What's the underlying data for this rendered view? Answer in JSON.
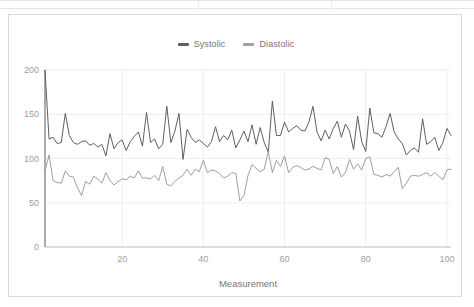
{
  "sheet_strip": {
    "name": "spreadsheet-row-strip",
    "visible": true,
    "column_divider_x": [
      198,
      331
    ]
  },
  "chart_card": {
    "background": "#ffffff",
    "border_color": "#d9d9d9"
  },
  "legend": {
    "position": "top-center",
    "items": [
      {
        "label": "Systolic",
        "color": "#5f5f5f"
      },
      {
        "label": "Diastolic",
        "color": "#9e9e9e"
      }
    ]
  },
  "axes": {
    "x": {
      "label": "Measurement",
      "ticks": [
        "20",
        "40",
        "60",
        "80",
        "100"
      ],
      "tick_values": [
        20,
        40,
        60,
        80,
        100
      ],
      "min": 1,
      "max": 101
    },
    "y": {
      "label": "",
      "ticks": [
        "0",
        "50",
        "100",
        "150",
        "200"
      ],
      "tick_values": [
        0,
        50,
        100,
        150,
        200
      ],
      "min": 0,
      "max": 200
    }
  },
  "chart_data": {
    "type": "line",
    "title": "",
    "subtitle": "",
    "xlabel": "Measurement",
    "ylabel": "",
    "xlim": [
      1,
      101
    ],
    "ylim": [
      0,
      200
    ],
    "grid": true,
    "grid_axis": "both",
    "legend_position": "top-center",
    "x": [
      1,
      2,
      3,
      4,
      5,
      6,
      7,
      8,
      9,
      10,
      11,
      12,
      13,
      14,
      15,
      16,
      17,
      18,
      19,
      20,
      21,
      22,
      23,
      24,
      25,
      26,
      27,
      28,
      29,
      30,
      31,
      32,
      33,
      34,
      35,
      36,
      37,
      38,
      39,
      40,
      41,
      42,
      43,
      44,
      45,
      46,
      47,
      48,
      49,
      50,
      51,
      52,
      53,
      54,
      55,
      56,
      57,
      58,
      59,
      60,
      61,
      62,
      63,
      64,
      65,
      66,
      67,
      68,
      69,
      70,
      71,
      72,
      73,
      74,
      75,
      76,
      77,
      78,
      79,
      80,
      81,
      82,
      83,
      84,
      85,
      86,
      87,
      88,
      89,
      90,
      91,
      92,
      93,
      94,
      95,
      96,
      97,
      98,
      99,
      100,
      101
    ],
    "series": [
      {
        "name": "Systolic",
        "color": "#5f5f5f",
        "values": [
          200,
          122,
          124,
          117,
          118,
          151,
          126,
          118,
          116,
          119,
          120,
          115,
          117,
          113,
          116,
          103,
          128,
          111,
          118,
          121,
          109,
          119,
          125,
          130,
          114,
          152,
          118,
          122,
          111,
          116,
          159,
          118,
          131,
          151,
          99,
          133,
          124,
          118,
          121,
          117,
          113,
          119,
          136,
          119,
          126,
          121,
          132,
          112,
          121,
          131,
          119,
          138,
          116,
          135,
          118,
          107,
          165,
          126,
          126,
          141,
          130,
          134,
          137,
          132,
          131,
          141,
          159,
          130,
          120,
          132,
          122,
          134,
          142,
          124,
          139,
          131,
          110,
          148,
          119,
          108,
          157,
          129,
          128,
          124,
          136,
          151,
          130,
          122,
          117,
          104,
          109,
          112,
          107,
          145,
          116,
          119,
          124,
          109,
          118,
          134,
          126
        ]
      },
      {
        "name": "Diastolic",
        "color": "#9e9e9e",
        "values": [
          86,
          104,
          75,
          73,
          72,
          86,
          80,
          79,
          67,
          58,
          74,
          71,
          80,
          77,
          72,
          84,
          75,
          70,
          74,
          77,
          76,
          80,
          78,
          86,
          78,
          78,
          77,
          81,
          75,
          91,
          71,
          69,
          74,
          78,
          81,
          88,
          81,
          88,
          85,
          98,
          84,
          87,
          86,
          83,
          78,
          80,
          84,
          83,
          52,
          58,
          81,
          93,
          89,
          85,
          88,
          108,
          84,
          98,
          91,
          103,
          84,
          90,
          92,
          90,
          87,
          88,
          91,
          89,
          87,
          101,
          99,
          83,
          91,
          79,
          84,
          99,
          88,
          94,
          87,
          100,
          102,
          82,
          81,
          79,
          82,
          80,
          85,
          90,
          66,
          72,
          80,
          81,
          80,
          82,
          84,
          80,
          84,
          80,
          76,
          87,
          88
        ]
      }
    ]
  }
}
